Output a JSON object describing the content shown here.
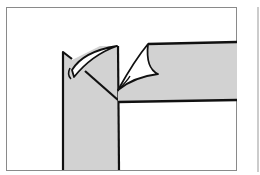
{
  "figure": {
    "colors": {
      "strip_fill": "#d2d2d2",
      "outline": "#111111",
      "frame": "#888888",
      "background": "#ffffff"
    }
  }
}
